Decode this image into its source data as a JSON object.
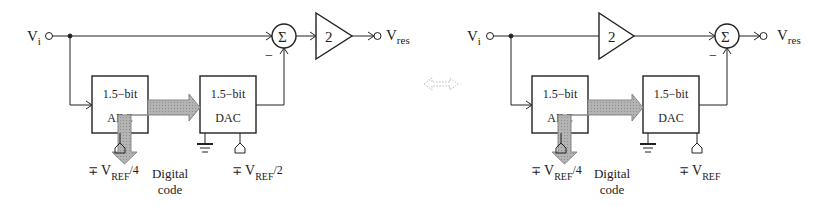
{
  "figure": {
    "left": {
      "input_label": "V",
      "input_sub": "i",
      "sum_symbol": "Σ",
      "minus_sign": "−",
      "amp_gain": "2",
      "output_label": "V",
      "output_sub": "res",
      "adc": {
        "line1": "1.5−bit",
        "line2": "ADC"
      },
      "dac": {
        "line1": "1.5−bit",
        "line2": "DAC"
      },
      "adc_ref": {
        "pm": "∓",
        "v": "V",
        "sub": "REF",
        "suffix": "/4"
      },
      "dac_ref": {
        "pm": "∓",
        "v": "V",
        "sub": "REF",
        "suffix": "/2"
      },
      "digital_code": {
        "line1": "Digital",
        "line2": "code"
      }
    },
    "equivalence_symbol": "⇔",
    "right": {
      "input_label": "V",
      "input_sub": "i",
      "sum_symbol": "Σ",
      "minus_sign": "−",
      "amp_gain": "2",
      "output_label": "V",
      "output_sub": "res",
      "adc": {
        "line1": "1.5−bit",
        "line2": "ADC"
      },
      "dac": {
        "line1": "1.5−bit",
        "line2": "DAC"
      },
      "adc_ref": {
        "pm": "∓",
        "v": "V",
        "sub": "REF",
        "suffix": "/4"
      },
      "dac_ref": {
        "pm": "∓",
        "v": "V",
        "sub": "REF",
        "suffix": ""
      },
      "digital_code": {
        "line1": "Digital",
        "line2": "code"
      }
    },
    "colors": {
      "line": "#222222",
      "arrow_fill": "#a8a8a8",
      "arrow_stroke": "#888888",
      "equiv": "#bbbbbb"
    }
  }
}
